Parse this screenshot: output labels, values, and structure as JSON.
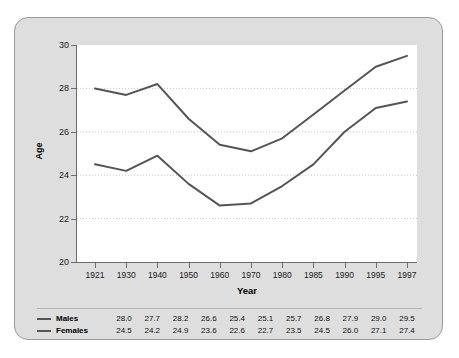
{
  "chart_data": {
    "type": "line",
    "title": "",
    "xlabel": "Year",
    "ylabel": "Age",
    "categories": [
      "1921",
      "1930",
      "1940",
      "1950",
      "1960",
      "1970",
      "1980",
      "1985",
      "1990",
      "1995",
      "1997"
    ],
    "series": [
      {
        "name": "Males",
        "color": "#555555",
        "values": [
          28.0,
          27.7,
          28.2,
          26.6,
          25.4,
          25.1,
          25.7,
          26.8,
          27.9,
          29.0,
          29.5
        ]
      },
      {
        "name": "Females",
        "color": "#555555",
        "values": [
          24.5,
          24.2,
          24.9,
          23.6,
          22.6,
          22.7,
          23.5,
          24.5,
          26.0,
          27.1,
          27.4
        ]
      }
    ],
    "ylim": [
      20,
      30
    ],
    "yticks": [
      20,
      22,
      24,
      26,
      28,
      30
    ],
    "grid": true,
    "grid_style": "dotted-horizontal",
    "legend_position": "bottom-table"
  },
  "colors": {
    "panel_background": "#dedede",
    "panel_border": "#9a9a9a",
    "plot_background": "#ffffff",
    "axis": "#6d6d6d",
    "gridline": "#c8c8c8",
    "line": "#555555",
    "text": "#111111"
  }
}
